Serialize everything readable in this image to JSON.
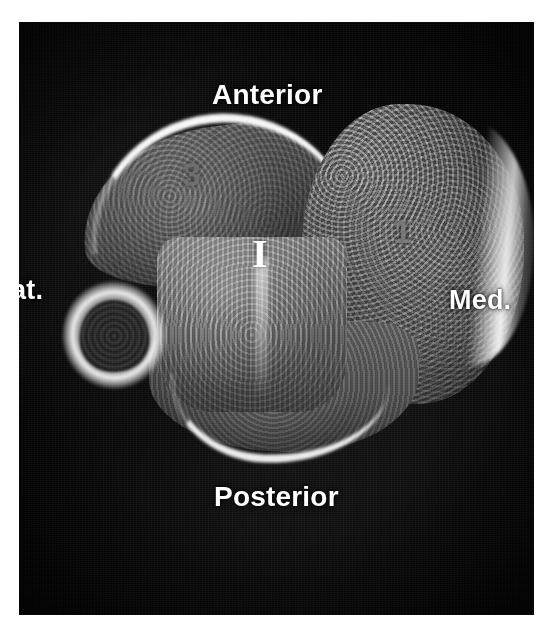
{
  "image": {
    "modality_view": "axial cross-section",
    "background_color": "#050505",
    "label_color": "#ffffff",
    "marker_color": "#fdfdfd",
    "numeral_color": "#787878"
  },
  "orientation_labels": {
    "top": "Anterior",
    "bottom": "Posterior",
    "right": "Med.",
    "left": "at."
  },
  "annotations": {
    "center_marker": "I",
    "numeral_upper_left": "3",
    "numeral_right": "1"
  },
  "structures": [
    {
      "name": "medial-bone-mass"
    },
    {
      "name": "anterior-lateral-bone"
    },
    {
      "name": "central-tarsal-block"
    },
    {
      "name": "posterior-bone-body"
    },
    {
      "name": "lateral-small-bone"
    }
  ]
}
